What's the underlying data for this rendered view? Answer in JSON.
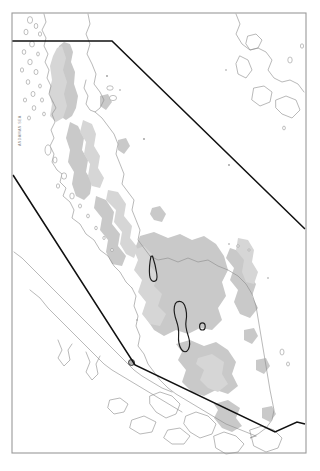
{
  "map": {
    "title": "Malay Peninsula regional map",
    "region": "Malay Peninsula (southern Thailand and Peninsular Malaysia)",
    "sea_label_west": "ANDAMAN SEA",
    "colors": {
      "background": "#ffffff",
      "frame_stroke": "#9a9a9a",
      "coastline_stroke": "#8d8d8d",
      "upland_fill": "#c9c9c9",
      "upland_soft_fill": "#d6d6d6",
      "boundary_stroke": "#111111",
      "study_area_stroke": "#1c1c1c",
      "study_dot_fill": "#b4b4b4"
    },
    "frame": {
      "name": "map-neatline",
      "x": 12,
      "y": 13,
      "width": 294,
      "height": 440
    },
    "legend_items": [
      {
        "key": "upland",
        "label": "Upland / highland shading",
        "swatch": "#c9c9c9"
      },
      {
        "key": "study_area",
        "label": "Study area outline",
        "swatch": "#1c1c1c"
      },
      {
        "key": "boundary",
        "label": "Analysis boundary",
        "swatch": "#111111"
      }
    ],
    "boundaries": [
      {
        "name": "upper-boundary-line",
        "description": "Horizontal segment along north then diagonal to the east margin",
        "points": "12,41 112,41 305,229"
      },
      {
        "name": "lower-boundary-line",
        "description": "Diagonal from west margin southeast to the southern tip then east",
        "points": "13,175 135,365 275,432 297,422 305,424"
      }
    ],
    "study_areas": [
      {
        "name": "study-area-north",
        "description": "Narrow elongated outline, northern interior"
      },
      {
        "name": "study-area-south",
        "description": "Larger curved elongated outline, central interior"
      },
      {
        "name": "study-area-ring",
        "description": "Small ring outline east of the southern area"
      },
      {
        "name": "study-point-west",
        "description": "Small filled circle near the west coast"
      }
    ]
  }
}
